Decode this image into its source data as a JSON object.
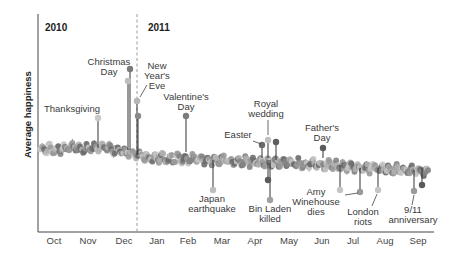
{
  "chart_data": {
    "type": "line",
    "title": "",
    "xlabel": "",
    "ylabel": "Average happiness",
    "grid": false,
    "year_labels": [
      "2010",
      "2011"
    ],
    "year_divider": "between Dec 2010 and Jan 2011",
    "categories": [
      "Oct",
      "Nov",
      "Dec",
      "Jan",
      "Feb",
      "Mar",
      "Apr",
      "May",
      "Jun",
      "Jul",
      "Aug",
      "Sep"
    ],
    "baseline_trend": {
      "description": "Daily average happiness, roughly flat in late 2010 then gently declining through 2011",
      "relative_values": [
        0.55,
        0.56,
        0.56,
        0.5,
        0.49,
        0.48,
        0.47,
        0.46,
        0.45,
        0.43,
        0.42,
        0.4
      ]
    },
    "annotations": [
      {
        "label": "Thanksgiving",
        "month": "Nov",
        "direction": "up",
        "relative_value": 0.72
      },
      {
        "label": "Christmas Day",
        "month": "Dec",
        "direction": "up",
        "relative_value": 0.94
      },
      {
        "label": "New Year's Eve",
        "month": "Dec",
        "direction": "up",
        "relative_value": 0.78
      },
      {
        "label": "Valentine's Day",
        "month": "Feb",
        "direction": "up",
        "relative_value": 0.75
      },
      {
        "label": "Japan earthquake",
        "month": "Mar",
        "direction": "down",
        "relative_value": 0.28
      },
      {
        "label": "Easter",
        "month": "Apr",
        "direction": "up",
        "relative_value": 0.63
      },
      {
        "label": "Royal wedding",
        "month": "Apr",
        "direction": "up",
        "relative_value": 0.64
      },
      {
        "label": "Bin Laden killed",
        "month": "May",
        "direction": "down",
        "relative_value": 0.3
      },
      {
        "label": "Father's Day",
        "month": "Jun",
        "direction": "up",
        "relative_value": 0.6
      },
      {
        "label": "Amy Winehouse dies",
        "month": "Jul",
        "direction": "down",
        "relative_value": 0.36
      },
      {
        "label": "London riots",
        "month": "Aug",
        "direction": "down",
        "relative_value": 0.35
      },
      {
        "label": "9/11 anniversary",
        "month": "Sep",
        "direction": "down",
        "relative_value": 0.35
      }
    ]
  },
  "labels": {
    "year_2010": "2010",
    "year_2011": "2011",
    "ylabel": "Average happiness",
    "months": [
      "Oct",
      "Nov",
      "Dec",
      "Jan",
      "Feb",
      "Mar",
      "Apr",
      "May",
      "Jun",
      "Jul",
      "Aug",
      "Sep"
    ],
    "thanksgiving": "Thanksgiving",
    "christmas_1": "Christmas",
    "christmas_2": "Day",
    "nye_1": "New",
    "nye_2": "Year's",
    "nye_3": "Eve",
    "valentine_1": "Valentine's",
    "valentine_2": "Day",
    "japan_1": "Japan",
    "japan_2": "earthquake",
    "easter": "Easter",
    "royal_1": "Royal",
    "royal_2": "wedding",
    "binladen_1": "Bin Laden",
    "binladen_2": "killed",
    "father_1": "Father's",
    "father_2": "Day",
    "amy_1": "Amy",
    "amy_2": "Winehouse",
    "amy_3": "dies",
    "london_1": "London",
    "london_2": "riots",
    "sept_1": "9/11",
    "sept_2": "anniversary"
  },
  "colors": {
    "axis": "#444444",
    "divider": "#999999",
    "dot_dark": "#6b6b6b",
    "dot_mid": "#9a9a9a",
    "dot_light": "#c4c4c4",
    "text": "#3a3a3a"
  }
}
